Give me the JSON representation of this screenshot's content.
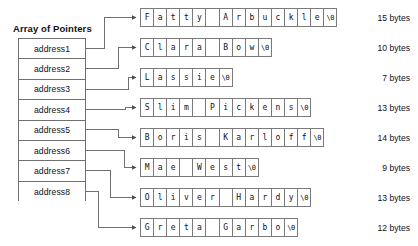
{
  "title": "Array of Pointers",
  "pointer_array": {
    "label": "Array of Pointers",
    "cells": [
      {
        "label": "address1"
      },
      {
        "label": "address2"
      },
      {
        "label": "address3"
      },
      {
        "label": "address4"
      },
      {
        "label": "address5"
      },
      {
        "label": "address6"
      },
      {
        "label": "address7"
      },
      {
        "label": "address8"
      }
    ]
  },
  "strings": [
    {
      "text": "Fatty Arbuckle",
      "cells": [
        "F",
        "a",
        "t",
        "t",
        "y",
        " ",
        "A",
        "r",
        "b",
        "u",
        "c",
        "k",
        "l",
        "e",
        "\\0"
      ],
      "size_label": "15 bytes",
      "bytes": 15
    },
    {
      "text": "Clara Bow",
      "cells": [
        "C",
        "l",
        "a",
        "r",
        "a",
        " ",
        "B",
        "o",
        "w",
        "\\0"
      ],
      "size_label": "10 bytes",
      "bytes": 10
    },
    {
      "text": "Lassie",
      "cells": [
        "L",
        "a",
        "s",
        "s",
        "i",
        "e",
        "\\0"
      ],
      "size_label": "7 bytes",
      "bytes": 7
    },
    {
      "text": "Slim Pickens",
      "cells": [
        "S",
        "l",
        "i",
        "m",
        " ",
        "P",
        "i",
        "c",
        "k",
        "e",
        "n",
        "s",
        "\\0"
      ],
      "size_label": "13 bytes",
      "bytes": 13
    },
    {
      "text": "Boris Karloff",
      "cells": [
        "B",
        "o",
        "r",
        "i",
        "s",
        " ",
        "K",
        "a",
        "r",
        "l",
        "o",
        "f",
        "f",
        "\\0"
      ],
      "size_label": "14 bytes",
      "bytes": 14
    },
    {
      "text": "Mae West",
      "cells": [
        "M",
        "a",
        "e",
        " ",
        "W",
        "e",
        "s",
        "t",
        "\\0"
      ],
      "size_label": "9 bytes",
      "bytes": 9
    },
    {
      "text": "Oliver Hardy",
      "cells": [
        "O",
        "l",
        "i",
        "v",
        "e",
        "r",
        " ",
        "H",
        "a",
        "r",
        "d",
        "y",
        "\\0"
      ],
      "size_label": "13 bytes",
      "bytes": 13
    },
    {
      "text": "Greta Garbo",
      "cells": [
        "G",
        "r",
        "e",
        "t",
        "a",
        " ",
        "G",
        "a",
        "r",
        "b",
        "o",
        "\\0"
      ],
      "size_label": "12 bytes",
      "bytes": 12
    }
  ],
  "colors": {
    "line": "#6f6f6f",
    "cell_border": "#7a7a7a",
    "text": "#111111",
    "background": "#ffffff"
  }
}
